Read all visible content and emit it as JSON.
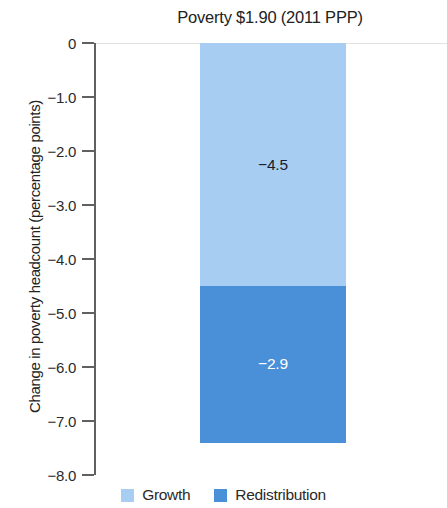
{
  "chart_data": {
    "type": "bar",
    "subtype": "stacked-bar-single-category",
    "title": "Poverty $1.90 (2011 PPP)",
    "xlabel": "",
    "ylabel": "Change in poverty headcount (percentage points)",
    "categories": [
      ""
    ],
    "series": [
      {
        "name": "Growth",
        "values": [
          -4.5
        ],
        "color": "#a7cdf2",
        "label_color": "#1b1b2e"
      },
      {
        "name": "Redistribution",
        "values": [
          -2.9
        ],
        "color": "#4a90d9",
        "label_color": "#ffffff"
      }
    ],
    "data_labels": [
      "−4.5",
      "−2.9"
    ],
    "total": -7.4,
    "ylim": [
      -8.0,
      0
    ],
    "y_ticks": [
      0,
      -1.0,
      -2.0,
      -3.0,
      -4.0,
      -5.0,
      -6.0,
      -7.0,
      -8.0
    ],
    "y_tick_labels": [
      "0",
      "−1.0",
      "−2.0",
      "−3.0",
      "−4.0",
      "−5.0",
      "−6.0",
      "−7.0",
      "−8.0"
    ],
    "grid": "zero-line-only",
    "legend_position": "bottom-center",
    "legend": [
      "Growth",
      "Redistribution"
    ],
    "background_color": "#ffffff",
    "axis_color": "#606060"
  },
  "chart": {
    "title": "Poverty $1.90 (2011 PPP)",
    "y_axis_title": "Change in poverty headcount (percentage points)",
    "ticks": [
      {
        "value": 0,
        "label": "0"
      },
      {
        "value": -1.0,
        "label": "−1.0"
      },
      {
        "value": -2.0,
        "label": "−2.0"
      },
      {
        "value": -3.0,
        "label": "−3.0"
      },
      {
        "value": -4.0,
        "label": "−4.0"
      },
      {
        "value": -5.0,
        "label": "−5.0"
      },
      {
        "value": -6.0,
        "label": "−6.0"
      },
      {
        "value": -7.0,
        "label": "−7.0"
      },
      {
        "value": -8.0,
        "label": "−8.0"
      }
    ],
    "segments": [
      {
        "name": "Growth",
        "value": -4.5,
        "label": "−4.5",
        "color": "#a7cdf2"
      },
      {
        "name": "Redistribution",
        "value": -2.9,
        "label": "−2.9",
        "color": "#4a90d9"
      }
    ],
    "legend": [
      {
        "name": "Growth",
        "label": "Growth",
        "color": "#a7cdf2"
      },
      {
        "name": "Redistribution",
        "label": "Redistribution",
        "color": "#4a90d9"
      }
    ]
  }
}
